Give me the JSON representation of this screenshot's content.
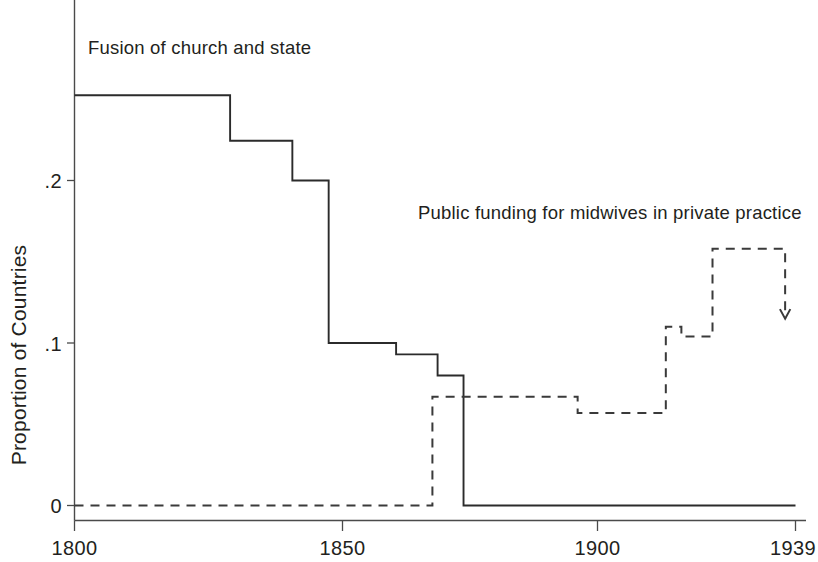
{
  "chart_data": {
    "type": "line",
    "title": "",
    "subtitle": "",
    "xlabel": "",
    "ylabel": "Proportion of Countries",
    "xlim": [
      1800,
      1939
    ],
    "ylim": [
      0,
      0.268
    ],
    "grid": false,
    "legend_position": "inline-annotations",
    "x_tick_labels": [
      "1800",
      "1850",
      "1900",
      "1939"
    ],
    "x_tick_values": [
      1800,
      1850,
      1900,
      1939
    ],
    "y_tick_labels": [
      "0",
      ".1",
      ".2"
    ],
    "y_tick_values": [
      0,
      0.1,
      0.2
    ],
    "series": [
      {
        "name": "Fusion of church and state",
        "style": "solid",
        "drawstyle": "steps-post",
        "annotation": "Fusion of church and state",
        "x": [
          1800,
          1830,
          1830,
          1842,
          1842,
          1849,
          1849,
          1862,
          1862,
          1870,
          1870,
          1875,
          1875,
          1939
        ],
        "values": [
          0.2525,
          0.2525,
          0.2245,
          0.2245,
          0.2,
          0.2,
          0.1,
          0.1,
          0.093,
          0.093,
          0.08,
          0.08,
          0.0,
          0.0
        ]
      },
      {
        "name": "Public funding for midwives in private practice",
        "style": "dashed",
        "drawstyle": "steps-post",
        "annotation": "Public funding for midwives in private practice",
        "end_marker": "down-arrow",
        "x": [
          1800,
          1869,
          1869,
          1897,
          1897,
          1914,
          1914,
          1917,
          1917,
          1923,
          1923,
          1937,
          1937
        ],
        "values": [
          0.0,
          0.0,
          0.067,
          0.067,
          0.057,
          0.057,
          0.11,
          0.11,
          0.104,
          0.104,
          0.158,
          0.158,
          0.115
        ]
      }
    ]
  },
  "axes": {
    "y_axis_title": "Proportion of Countries",
    "y_tick_0": "0",
    "y_tick_1": ".1",
    "y_tick_2": ".2",
    "x_tick_0": "1800",
    "x_tick_1": "1850",
    "x_tick_2": "1900",
    "x_tick_3": "1939"
  },
  "annotations": {
    "solid_label": "Fusion of church and state",
    "dashed_label": "Public funding for midwives in private practice"
  },
  "colors": {
    "background": "#ffffff",
    "solid_line": "#2b2b2b",
    "dashed_line": "#3a3a3a",
    "axis": "#4a4a4a",
    "text": "#231f20"
  }
}
